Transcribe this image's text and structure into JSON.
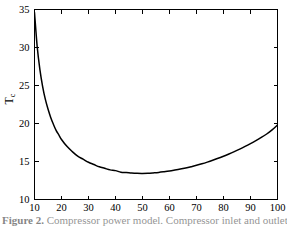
{
  "figure": {
    "caption_prefix": "Figure 2.",
    "caption_text": "Compressor power model. Compressor inlet and outlet pressure."
  },
  "chart_data": {
    "type": "line",
    "title": "",
    "subtitle": "",
    "xlabel": "",
    "ylabel": "T_c",
    "ylabel_base": "T",
    "ylabel_sub": "c",
    "xlim": [
      10,
      100
    ],
    "ylim": [
      10,
      35
    ],
    "grid": false,
    "legend": false,
    "legend_position": "none",
    "xticks": [
      10,
      20,
      30,
      40,
      50,
      60,
      70,
      80,
      90,
      100
    ],
    "xticklabels": [
      "10",
      "20",
      "30",
      "40",
      "50",
      "60",
      "70",
      "80",
      "90",
      "100"
    ],
    "yticks": [
      10,
      15,
      20,
      25,
      30,
      35
    ],
    "yticklabels": [
      "10",
      "15",
      "20",
      "25",
      "30",
      "35"
    ],
    "minor_ticks": false,
    "tick_direction": "in",
    "box": true,
    "series": [
      {
        "name": "Tc",
        "color": "#000000",
        "linewidth": 1.5,
        "x": [
          10,
          11,
          12,
          13,
          14,
          15,
          16,
          17,
          18,
          19,
          20,
          22,
          24,
          26,
          28,
          30,
          32,
          34,
          36,
          38,
          40,
          42,
          44,
          46,
          48,
          50,
          52,
          54,
          56,
          58,
          60,
          62,
          64,
          66,
          68,
          70,
          72,
          74,
          76,
          78,
          80,
          82,
          84,
          86,
          88,
          90,
          92,
          94,
          96,
          98,
          100
        ],
        "y": [
          34.6,
          30.1,
          27.1,
          24.9,
          23.2,
          21.9,
          20.8,
          19.9,
          19.1,
          18.5,
          17.9,
          17.0,
          16.3,
          15.7,
          15.3,
          14.9,
          14.6,
          14.3,
          14.1,
          13.9,
          13.8,
          13.6,
          13.55,
          13.48,
          13.44,
          13.43,
          13.45,
          13.5,
          13.56,
          13.65,
          13.75,
          13.87,
          14.0,
          14.15,
          14.32,
          14.5,
          14.7,
          14.92,
          15.16,
          15.42,
          15.7,
          15.99,
          16.3,
          16.63,
          16.98,
          17.35,
          17.74,
          18.16,
          18.62,
          19.16,
          19.8
        ]
      }
    ],
    "annotations": {
      "minimum_x": 49,
      "minimum_y": 13.43,
      "start_x": 10,
      "start_y": 34.6,
      "end_x": 100,
      "end_y": 19.8
    }
  }
}
